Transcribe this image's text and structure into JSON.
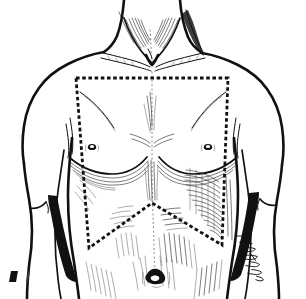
{
  "figure": {
    "style": "pen-and-ink medical line drawing",
    "background_color": "#ffffff",
    "ink_color": "#111111",
    "shadow_color": "#111111",
    "marking_color": "#111111",
    "caption": "",
    "signature_label": "artist-signature"
  },
  "anatomy": {
    "labels": {
      "neck": "neck",
      "sternocleidomastoid_left": "left sternocleidomastoid",
      "sternocleidomastoid_right": "right sternocleidomastoid",
      "suprasternal_notch": "suprasternal notch",
      "clavicle_left": "left clavicle",
      "clavicle_right": "right clavicle",
      "deltoid_left": "left deltoid",
      "deltoid_right": "right deltoid",
      "pectoralis_left": "left pectoralis major",
      "pectoralis_right": "right pectoralis major",
      "nipple_left": "left nipple",
      "nipple_right": "right nipple",
      "rectus_abdominis": "rectus abdominis",
      "external_oblique": "external oblique",
      "linea_alba": "linea alba midline",
      "umbilicus": "umbilicus",
      "arm_left": "left upper arm",
      "arm_right": "right upper arm",
      "axilla_shadow_left": "left axillary shadow",
      "axilla_shadow_right": "right axillary shadow"
    },
    "landmark_points": {
      "nipple_left": [
        92,
        147
      ],
      "nipple_right": [
        208,
        147
      ],
      "umbilicus": [
        155,
        277
      ],
      "suprasternal_notch": [
        151,
        57
      ]
    }
  },
  "marking": {
    "name": "incision-outline",
    "description": "dashed pentagonal marking over chest and upper abdomen",
    "shape": "pentagon",
    "vertices": [
      [
        76,
        78
      ],
      [
        228,
        78
      ],
      [
        222,
        245
      ],
      [
        152,
        203
      ],
      [
        89,
        248
      ]
    ],
    "dash_pattern": "3.6 2.6",
    "stroke_width": 2.8,
    "color": "#111111"
  },
  "midline": {
    "name": "linea-alba-guide",
    "description": "faint dotted vertical midline from sternum to umbilicus",
    "color": "#6d6d6d",
    "dash_pattern": "1.1 3.2"
  }
}
